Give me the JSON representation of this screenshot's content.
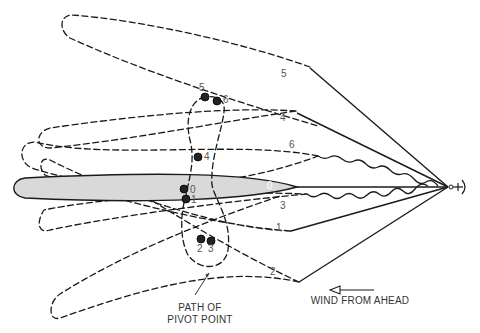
{
  "diagram": {
    "type": "ship swinging at anchor — positions of hull and path of pivot point",
    "positions": [
      {
        "id": "0",
        "label": "0",
        "style": "solid-shaded"
      },
      {
        "id": "1",
        "label": "1",
        "style": "dashed"
      },
      {
        "id": "2",
        "label": "2",
        "style": "dashed"
      },
      {
        "id": "3",
        "label": "3",
        "style": "dashed"
      },
      {
        "id": "4",
        "label": "4",
        "style": "dashed"
      },
      {
        "id": "5",
        "label": "5",
        "style": "dashed"
      },
      {
        "id": "6",
        "label": "6",
        "style": "dashed"
      }
    ],
    "pivot_points": [
      {
        "label": "0"
      },
      {
        "label": "1"
      },
      {
        "label": "2"
      },
      {
        "label": "3"
      },
      {
        "label": "4"
      },
      {
        "label": "5"
      },
      {
        "label": "6"
      }
    ],
    "annotations": {
      "pivot_path_line1": "PATH OF",
      "pivot_path_line2": "PIVOT POINT",
      "wind": "WIND FROM AHEAD"
    },
    "icons": {
      "anchor": "anchor-icon",
      "wind_arrow": "arrow-left-icon"
    },
    "colors": {
      "line": "#1a1a1a",
      "hull_fill": "#d9d9d9",
      "text": "#555555"
    }
  }
}
